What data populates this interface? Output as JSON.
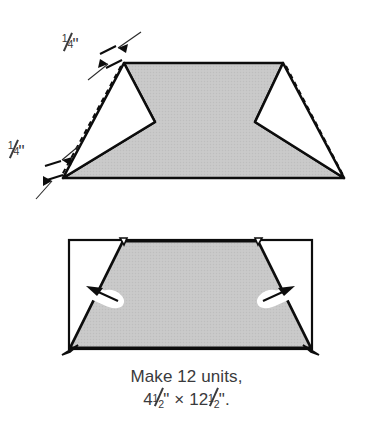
{
  "figure": {
    "colors": {
      "fabric_gray": "#c8c8c8",
      "outline_black": "#0d0d0d",
      "background": "#ffffff",
      "caption_text": "#3a3a3c",
      "white_fabric": "#ffffff"
    },
    "top_diagram": {
      "name": "unit-with-flaps-open",
      "seam_labels": [
        {
          "id": "seam-top-left",
          "text": "1/4\"",
          "numerator": "1",
          "denominator": "4",
          "unit": "\""
        },
        {
          "id": "seam-bottom-left",
          "text": "1/4\"",
          "numerator": "1",
          "denominator": "4",
          "unit": "\""
        }
      ],
      "stitch_line_style": "dashed",
      "flaps": [
        "left-triangle-flap",
        "right-triangle-flap"
      ]
    },
    "bottom_diagram": {
      "name": "finished-unit-pressed",
      "press_arrows": [
        "press-arrow-left",
        "press-arrow-right"
      ],
      "dog_ears": [
        "dog-ear-top-left",
        "dog-ear-top-right",
        "dog-ear-bottom-left",
        "dog-ear-bottom-right"
      ]
    }
  },
  "caption": {
    "line1": "Make 12 units,",
    "quantity": "12",
    "unit_word": "units",
    "width_whole": "4",
    "width_num": "1",
    "width_den": "2",
    "height_whole": "12",
    "height_num": "1",
    "height_den": "2",
    "times_symbol": "×",
    "inch_mark": "\"",
    "period": "."
  }
}
